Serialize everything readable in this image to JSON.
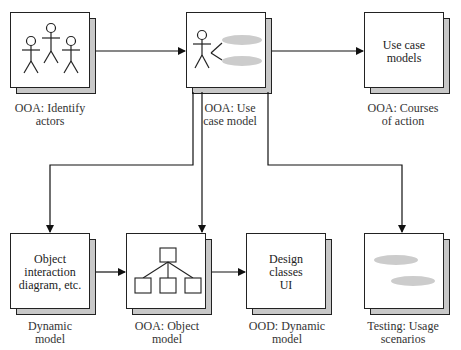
{
  "diagram": {
    "nodes": [
      {
        "id": "identify-actors",
        "inner_text": "",
        "caption": "OOA: Identify\nactors",
        "icon": "actors-icon"
      },
      {
        "id": "use-case-model",
        "inner_text": "",
        "caption": "OOA: Use\ncase model",
        "icon": "use-case-icon"
      },
      {
        "id": "courses-of-action",
        "inner_text": "Use case\nmodels",
        "caption": "OOA: Courses\nof action",
        "icon": ""
      },
      {
        "id": "dynamic-model",
        "inner_text": "Object\ninteraction\ndiagram, etc.",
        "caption": "Dynamic\nmodel",
        "icon": ""
      },
      {
        "id": "object-model",
        "inner_text": "",
        "caption": "OOA: Object\nmodel",
        "icon": "hierarchy-icon"
      },
      {
        "id": "ood-dynamic-model",
        "inner_text": "Design\nclasses\nUI",
        "caption": "OOD: Dynamic\nmodel",
        "icon": ""
      },
      {
        "id": "usage-scenarios",
        "inner_text": "",
        "caption": "Testing: Usage\nscenarios",
        "icon": "scenarios-icon"
      }
    ],
    "edges": [
      {
        "from": "identify-actors",
        "to": "use-case-model"
      },
      {
        "from": "use-case-model",
        "to": "courses-of-action"
      },
      {
        "from": "use-case-model",
        "to": "dynamic-model"
      },
      {
        "from": "use-case-model",
        "to": "object-model"
      },
      {
        "from": "use-case-model",
        "to": "usage-scenarios"
      },
      {
        "from": "dynamic-model",
        "to": "object-model"
      },
      {
        "from": "object-model",
        "to": "ood-dynamic-model"
      }
    ],
    "colors": {
      "line": "#111111",
      "shadow": "#c8c8c8",
      "ellipse": "#cccccc"
    }
  }
}
